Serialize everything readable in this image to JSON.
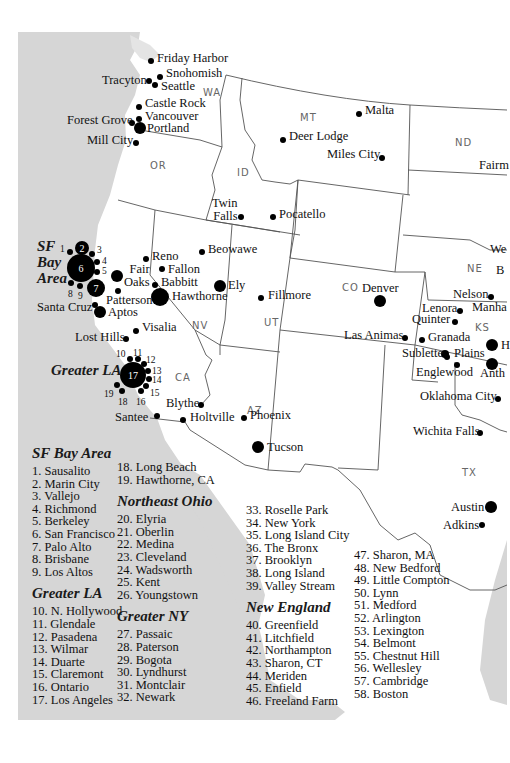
{
  "map": {
    "colors": {
      "ocean": "#d6d6d6",
      "land": "#ffffff",
      "border": "#555555",
      "dot": "#000000",
      "state_label": "#666666"
    },
    "states": [
      {
        "abbr": "WA",
        "x": 203,
        "y": 87
      },
      {
        "abbr": "MT",
        "x": 300,
        "y": 112
      },
      {
        "abbr": "ND",
        "x": 455,
        "y": 137
      },
      {
        "abbr": "OR",
        "x": 150,
        "y": 160
      },
      {
        "abbr": "ID",
        "x": 237,
        "y": 167
      },
      {
        "abbr": "NE",
        "x": 467,
        "y": 263
      },
      {
        "abbr": "CO",
        "x": 342,
        "y": 282
      },
      {
        "abbr": "KS",
        "x": 475,
        "y": 322
      },
      {
        "abbr": "UT",
        "x": 264,
        "y": 317
      },
      {
        "abbr": "NV",
        "x": 192,
        "y": 320
      },
      {
        "abbr": "CA",
        "x": 175,
        "y": 372
      },
      {
        "abbr": "AZ",
        "x": 247,
        "y": 405
      },
      {
        "abbr": "TX",
        "x": 462,
        "y": 467
      }
    ],
    "cities": [
      {
        "name": "Friday Harbor",
        "dot_x": 151,
        "dot_y": 61,
        "r": 3,
        "lx": 157,
        "ly": 52
      },
      {
        "name": "Snohomish",
        "dot_x": 160,
        "dot_y": 77,
        "r": 3,
        "lx": 166,
        "ly": 67
      },
      {
        "name": "Tracyton",
        "dot_x": 149,
        "dot_y": 81,
        "r": 3,
        "lx": 102,
        "ly": 74
      },
      {
        "name": "Seattle",
        "dot_x": 155,
        "dot_y": 85,
        "r": 3,
        "lx": 161,
        "ly": 80
      },
      {
        "name": "Castle Rock",
        "dot_x": 139,
        "dot_y": 107,
        "r": 3,
        "lx": 145,
        "ly": 97
      },
      {
        "name": "Vancouver",
        "dot_x": 139,
        "dot_y": 119,
        "r": 3,
        "lx": 145,
        "ly": 110
      },
      {
        "name": "Forest Grove",
        "dot_x": 132,
        "dot_y": 123,
        "r": 3,
        "lx": 67,
        "ly": 114
      },
      {
        "name": "Portland",
        "dot_x": 140,
        "dot_y": 128,
        "r": 6,
        "lx": 147,
        "ly": 122
      },
      {
        "name": "Mill City",
        "dot_x": 136,
        "dot_y": 143,
        "r": 3,
        "lx": 87,
        "ly": 134
      },
      {
        "name": "Malta",
        "dot_x": 359,
        "dot_y": 114,
        "r": 3,
        "lx": 365,
        "ly": 104
      },
      {
        "name": "Deer Lodge",
        "dot_x": 283,
        "dot_y": 140,
        "r": 3,
        "lx": 289,
        "ly": 130
      },
      {
        "name": "Miles City",
        "dot_x": 382,
        "dot_y": 158,
        "r": 3,
        "lx": 327,
        "ly": 148
      },
      {
        "name": "Fairm",
        "dot_x": null,
        "dot_y": null,
        "r": 0,
        "lx": 479,
        "ly": 159
      },
      {
        "name": "Twin\nFalls",
        "dot_x": 241,
        "dot_y": 217,
        "r": 3,
        "lx": 212,
        "ly": 197
      },
      {
        "name": "Pocatello",
        "dot_x": 273,
        "dot_y": 217,
        "r": 3,
        "lx": 279,
        "ly": 208
      },
      {
        "name": "Beowawe",
        "dot_x": 202,
        "dot_y": 252,
        "r": 3,
        "lx": 208,
        "ly": 243
      },
      {
        "name": "Reno",
        "dot_x": 146,
        "dot_y": 259,
        "r": 3,
        "lx": 152,
        "ly": 250
      },
      {
        "name": "Fallon",
        "dot_x": 162,
        "dot_y": 269,
        "r": 3,
        "lx": 168,
        "ly": 263
      },
      {
        "name": "Fair\nOaks",
        "dot_x": 117,
        "dot_y": 276,
        "r": 6,
        "lx": 124,
        "ly": 263
      },
      {
        "name": "Babbitt",
        "dot_x": 155,
        "dot_y": 285,
        "r": 3,
        "lx": 161,
        "ly": 276
      },
      {
        "name": "Ely",
        "dot_x": 220,
        "dot_y": 286,
        "r": 6,
        "lx": 228,
        "ly": 279
      },
      {
        "name": "Hawthorne",
        "dot_x": 160,
        "dot_y": 297,
        "r": 9,
        "lx": 172,
        "ly": 290
      },
      {
        "name": "Fillmore",
        "dot_x": 261,
        "dot_y": 298,
        "r": 3,
        "lx": 268,
        "ly": 289
      },
      {
        "name": "Patterson",
        "dot_x": 118,
        "dot_y": 291,
        "r": 3,
        "lx": 106,
        "ly": 294
      },
      {
        "name": "Santa Cruz",
        "dot_x": 95,
        "dot_y": 305,
        "r": 3,
        "lx": 37,
        "ly": 301
      },
      {
        "name": "Aptos",
        "dot_x": 100,
        "dot_y": 312,
        "r": 6,
        "lx": 108,
        "ly": 306
      },
      {
        "name": "Denver",
        "dot_x": 380,
        "dot_y": 301,
        "r": 6,
        "lx": 362,
        "ly": 282
      },
      {
        "name": "We",
        "dot_x": null,
        "dot_y": null,
        "r": 0,
        "lx": 490,
        "ly": 243
      },
      {
        "name": "B",
        "dot_x": null,
        "dot_y": null,
        "r": 0,
        "lx": 496,
        "ly": 264
      },
      {
        "name": "Nelson",
        "dot_x": 491,
        "dot_y": 297,
        "r": 3,
        "lx": 453,
        "ly": 288
      },
      {
        "name": "Lenora",
        "dot_x": 460,
        "dot_y": 311,
        "r": 3,
        "lx": 422,
        "ly": 302
      },
      {
        "name": "Manha",
        "dot_x": null,
        "dot_y": null,
        "r": 0,
        "lx": 472,
        "ly": 301
      },
      {
        "name": "Quinter",
        "dot_x": 455,
        "dot_y": 322,
        "r": 3,
        "lx": 412,
        "ly": 313
      },
      {
        "name": "Las Animas",
        "dot_x": 405,
        "dot_y": 338,
        "r": 3,
        "lx": 344,
        "ly": 329
      },
      {
        "name": "Granada",
        "dot_x": 422,
        "dot_y": 340,
        "r": 3,
        "lx": 428,
        "ly": 331
      },
      {
        "name": "Sublette",
        "dot_x": 445,
        "dot_y": 354,
        "r": 4,
        "lx": 402,
        "ly": 347
      },
      {
        "name": "Plains",
        "dot_x": 447,
        "dot_y": 357,
        "r": 3,
        "lx": 454,
        "ly": 347
      },
      {
        "name": "H",
        "dot_x": 492,
        "dot_y": 345,
        "r": 6,
        "lx": 501,
        "ly": 339
      },
      {
        "name": "Anth",
        "dot_x": 492,
        "dot_y": 364,
        "r": 6,
        "lx": 480,
        "ly": 367
      },
      {
        "name": "Englewood",
        "dot_x": 457,
        "dot_y": 365,
        "r": 3,
        "lx": 416,
        "ly": 366
      },
      {
        "name": "Visalia",
        "dot_x": 136,
        "dot_y": 331,
        "r": 3,
        "lx": 142,
        "ly": 321
      },
      {
        "name": "Lost Hills",
        "dot_x": 126,
        "dot_y": 339,
        "r": 3,
        "lx": 75,
        "ly": 331
      },
      {
        "name": "Blythe",
        "dot_x": 201,
        "dot_y": 405,
        "r": 3,
        "lx": 166,
        "ly": 397
      },
      {
        "name": "Santee",
        "dot_x": 157,
        "dot_y": 416,
        "r": 3,
        "lx": 115,
        "ly": 411
      },
      {
        "name": "Holtville",
        "dot_x": 183,
        "dot_y": 420,
        "r": 3,
        "lx": 190,
        "ly": 411
      },
      {
        "name": "Phoenix",
        "dot_x": 244,
        "dot_y": 418,
        "r": 3,
        "lx": 250,
        "ly": 409
      },
      {
        "name": "Tucson",
        "dot_x": 258,
        "dot_y": 447,
        "r": 6,
        "lx": 267,
        "ly": 441
      },
      {
        "name": "Oklahoma City",
        "dot_x": 498,
        "dot_y": 399,
        "r": 3,
        "lx": 420,
        "ly": 390
      },
      {
        "name": "Wichita Falls",
        "dot_x": 480,
        "dot_y": 433,
        "r": 3,
        "lx": 413,
        "ly": 425
      },
      {
        "name": "Austin",
        "dot_x": 491,
        "dot_y": 507,
        "r": 6,
        "lx": 451,
        "ly": 501
      },
      {
        "name": "Adkins",
        "dot_x": 482,
        "dot_y": 525,
        "r": 3,
        "lx": 443,
        "ly": 519
      }
    ],
    "clusters": [
      {
        "name": "SF\nBay\nArea",
        "label_x": 37,
        "label_y": 238,
        "center": {
          "num": "6",
          "x": 81,
          "y": 268,
          "r": 14
        },
        "dots": [
          {
            "num": "1",
            "x": 70,
            "y": 252,
            "r": 3,
            "nx": 60,
            "ny": 244
          },
          {
            "num": "2",
            "x": 82,
            "y": 248,
            "r": 7,
            "white": true
          },
          {
            "num": "3",
            "x": 92,
            "y": 254,
            "r": 3,
            "nx": 97,
            "ny": 245
          },
          {
            "num": "4",
            "x": 97,
            "y": 262,
            "r": 3,
            "nx": 102,
            "ny": 256
          },
          {
            "num": "5",
            "x": 97,
            "y": 272,
            "r": 3,
            "nx": 102,
            "ny": 266
          },
          {
            "num": "7",
            "x": 96,
            "y": 288,
            "r": 9,
            "white": true
          },
          {
            "num": "8",
            "x": 71,
            "y": 283,
            "r": 3,
            "nx": 68,
            "ny": 289
          },
          {
            "num": "9",
            "x": 80,
            "y": 286,
            "r": 3,
            "nx": 78,
            "ny": 291
          }
        ]
      },
      {
        "name": "Greater LA",
        "label_x": 51,
        "label_y": 362,
        "center": {
          "num": "17",
          "x": 133,
          "y": 375,
          "r": 13
        },
        "dots": [
          {
            "num": "10",
            "x": 130,
            "y": 359,
            "r": 3,
            "nx": 116,
            "ny": 349
          },
          {
            "num": "11",
            "x": 138,
            "y": 359,
            "r": 3,
            "nx": 133,
            "ny": 348
          },
          {
            "num": "12",
            "x": 144,
            "y": 364,
            "r": 3,
            "nx": 146,
            "ny": 355
          },
          {
            "num": "13",
            "x": 148,
            "y": 371,
            "r": 3,
            "nx": 152,
            "ny": 366
          },
          {
            "num": "14",
            "x": 149,
            "y": 379,
            "r": 3,
            "nx": 152,
            "ny": 375
          },
          {
            "num": "15",
            "x": 146,
            "y": 386,
            "r": 3,
            "nx": 150,
            "ny": 388
          },
          {
            "num": "16",
            "x": 141,
            "y": 391,
            "r": 3,
            "nx": 136,
            "ny": 397
          },
          {
            "num": "18",
            "x": 122,
            "y": 391,
            "r": 3,
            "nx": 118,
            "ny": 397
          },
          {
            "num": "19",
            "x": 117,
            "y": 385,
            "r": 3,
            "nx": 104,
            "ny": 389
          }
        ]
      }
    ]
  },
  "legend": {
    "columns": [
      {
        "x": 32,
        "y": 445,
        "groups": [
          {
            "title": "SF Bay Area",
            "items": [
              "1. Sausalito",
              "2. Marin City",
              "3. Vallejo",
              "4. Richmond",
              "5. Berkeley",
              "6. San Francisco",
              "7. Palo Alto",
              "8. Brisbane",
              "9. Los Altos"
            ]
          },
          {
            "title": "Greater LA",
            "items": [
              "10. N. Hollywood",
              "11. Glendale",
              "12. Pasadena",
              "13. Wilmar",
              "14. Duarte",
              "15. Claremont",
              "16. Ontario",
              "17. Los Angeles"
            ]
          }
        ]
      },
      {
        "x": 117,
        "y": 461,
        "groups": [
          {
            "title": "",
            "items": [
              "18. Long Beach",
              "19. Hawthorne, CA"
            ]
          },
          {
            "title": "Northeast Ohio",
            "items": [
              "20. Elyria",
              "21. Oberlin",
              "22. Medina",
              "23. Cleveland",
              "24. Wadsworth",
              "25. Kent",
              "26. Youngstown"
            ]
          },
          {
            "title": "Greater NY",
            "items": [
              "27. Passaic",
              "28. Paterson",
              "29. Bogota",
              "30. Lyndhurst",
              "31. Montclair",
              "32. Newark"
            ]
          }
        ]
      },
      {
        "x": 246,
        "y": 504,
        "groups": [
          {
            "title": "",
            "items": [
              "33. Roselle Park",
              "34. New York",
              "35. Long Island City",
              "36. The Bronx",
              "37. Brooklyn",
              "38. Long Island",
              "39. Valley Stream"
            ]
          },
          {
            "title": "New England",
            "items": [
              "40. Greenfield",
              "41. Litchfield",
              "42. Northampton",
              "43. Sharon, CT",
              "44. Meriden",
              "45. Enfield",
              "46. Freeland Farm"
            ]
          }
        ]
      },
      {
        "x": 354,
        "y": 549,
        "groups": [
          {
            "title": "",
            "items": [
              "47. Sharon, MA",
              "48. New Bedford",
              "49. Little Compton",
              "50. Lynn",
              "51. Medford",
              "52. Arlington",
              "53. Lexington",
              "54. Belmont",
              "55. Chestnut Hill",
              "56. Wellesley",
              "57. Cambridge",
              "58. Boston"
            ]
          }
        ]
      }
    ]
  }
}
